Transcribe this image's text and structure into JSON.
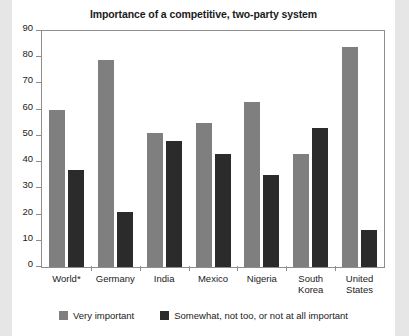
{
  "chart_data": {
    "type": "bar",
    "title": "Importance of a competitive, two-party system",
    "xlabel": "",
    "ylabel": "",
    "ylim": [
      0,
      90
    ],
    "yticks": [
      0,
      10,
      20,
      30,
      40,
      50,
      60,
      70,
      80,
      90
    ],
    "grid": false,
    "legend_position": "bottom",
    "categories": [
      "World*",
      "Germany",
      "India",
      "Mexico",
      "Nigeria",
      "South\nKorea",
      "United\nStates"
    ],
    "series": [
      {
        "name": "Very important",
        "color": "#7f7f7f",
        "values": [
          60,
          79,
          51,
          55,
          63,
          43,
          84
        ]
      },
      {
        "name": "Somewhat, not too, or not at all important",
        "color": "#2b2b2b",
        "values": [
          37,
          21,
          48,
          43,
          35,
          53,
          14
        ]
      }
    ]
  },
  "colors": {
    "series0": "#7f7f7f",
    "series1": "#2b2b2b",
    "axis": "#8d8d8d",
    "text": "#1b1b1b",
    "background": "#ffffff",
    "page_margin": "#e6e6e6"
  }
}
